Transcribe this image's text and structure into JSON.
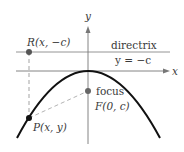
{
  "diagram": {
    "type": "parabola-focus-directrix",
    "axes": {
      "x_label": "x",
      "y_label": "y"
    },
    "directrix": {
      "label": "directrix",
      "equation": "y = −c"
    },
    "points": {
      "R": {
        "label": "R(x, −c)"
      },
      "F": {
        "label_word": "focus",
        "label": "F(0, c)"
      },
      "P": {
        "label": "P(x, y)"
      }
    },
    "colors": {
      "curve": "#111111",
      "axes": "#777777",
      "dashed": "#999999",
      "point": "#555555",
      "text": "#3a3a3a"
    }
  }
}
